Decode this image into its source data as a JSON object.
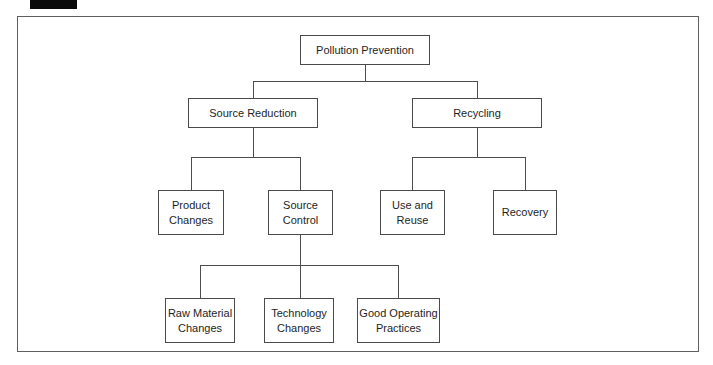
{
  "colors": {
    "line": "#4d4d4d",
    "box_border": "#4a4a4a",
    "text": "#1e1e1e",
    "background": "#ffffff",
    "scan_mark": "#0a0a0a"
  },
  "nodes": {
    "pollution_prevention": {
      "label": "Pollution Prevention"
    },
    "source_reduction": {
      "label": "Source Reduction"
    },
    "recycling": {
      "label": "Recycling"
    },
    "product_changes": {
      "label": "Product Changes"
    },
    "source_control": {
      "label": "Source Control"
    },
    "use_and_reuse": {
      "label": "Use and Reuse"
    },
    "recovery": {
      "label": "Recovery"
    },
    "raw_material_changes": {
      "label": "Raw Material Changes"
    },
    "technology_changes": {
      "label": "Technology Changes"
    },
    "good_operating_practices": {
      "label": "Good Operating Practices"
    }
  },
  "hierarchy": {
    "root": "Pollution Prevention",
    "children": [
      {
        "label": "Source Reduction",
        "children": [
          {
            "label": "Product Changes"
          },
          {
            "label": "Source Control",
            "children": [
              {
                "label": "Raw Material Changes"
              },
              {
                "label": "Technology Changes"
              },
              {
                "label": "Good Operating Practices"
              }
            ]
          }
        ]
      },
      {
        "label": "Recycling",
        "children": [
          {
            "label": "Use and Reuse"
          },
          {
            "label": "Recovery"
          }
        ]
      }
    ]
  }
}
